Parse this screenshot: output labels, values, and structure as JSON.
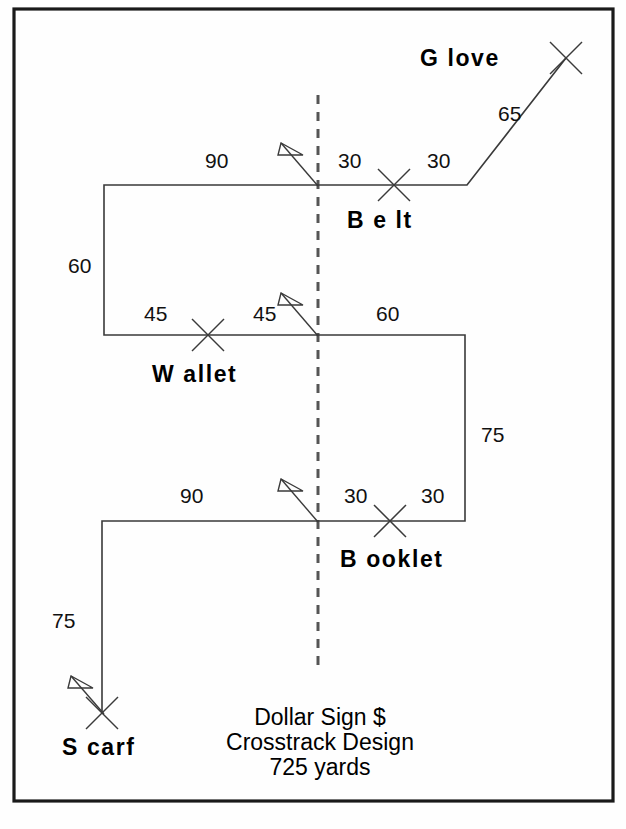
{
  "diagram": {
    "title_lines": [
      "Dollar Sign $",
      "Crosstrack Design",
      "725 yards"
    ],
    "total_distance": "725 yards",
    "design_name": "Dollar Sign $",
    "design_type": "Crosstrack Design",
    "colors": {
      "frame": "#1a1a1a",
      "route": "#3a3a3a",
      "centerline": "#555555",
      "text": "#000000",
      "background": "#ffffff"
    },
    "stations": [
      {
        "id": "glove",
        "label": "G love",
        "x": 566,
        "y": 58,
        "label_x": 468,
        "label_y": 64
      },
      {
        "id": "belt",
        "label": "B e lt",
        "x": 394,
        "y": 185,
        "label_x": 348,
        "label_y": 226
      },
      {
        "id": "wallet",
        "label": "W allet",
        "x": 208,
        "y": 335,
        "label_x": 152,
        "label_y": 381
      },
      {
        "id": "booklet",
        "label": "B ooklet",
        "x": 390,
        "y": 521,
        "label_x": 340,
        "label_y": 566
      },
      {
        "id": "scarf",
        "label": "S carf",
        "x": 102,
        "y": 713,
        "label_x": 62,
        "label_y": 755
      }
    ],
    "flags": [
      {
        "id": "flag-belt",
        "apex_x": 318,
        "apex_y": 185
      },
      {
        "id": "flag-wallet",
        "apex_x": 318,
        "apex_y": 335
      },
      {
        "id": "flag-booklet",
        "apex_x": 318,
        "apex_y": 521
      },
      {
        "id": "flag-scarf",
        "apex_x": 102,
        "apex_y": 713
      }
    ],
    "distance_labels": [
      {
        "id": "dist-glove-65",
        "value": "65",
        "x": 498,
        "y": 121
      },
      {
        "id": "dist-belt-left-90",
        "value": "90",
        "x": 215,
        "y": 168
      },
      {
        "id": "dist-belt-30a",
        "value": "30",
        "x": 348,
        "y": 168
      },
      {
        "id": "dist-belt-30b",
        "value": "30",
        "x": 437,
        "y": 168
      },
      {
        "id": "dist-left-60",
        "value": "60",
        "x": 70,
        "y": 273
      },
      {
        "id": "dist-wallet-45a",
        "value": "45",
        "x": 149,
        "y": 320
      },
      {
        "id": "dist-wallet-45b",
        "value": "45",
        "x": 258,
        "y": 320
      },
      {
        "id": "dist-wallet-60",
        "value": "60",
        "x": 378,
        "y": 320
      },
      {
        "id": "dist-right-75",
        "value": "75",
        "x": 481,
        "y": 442
      },
      {
        "id": "dist-booklet-90",
        "value": "90",
        "x": 183,
        "y": 502
      },
      {
        "id": "dist-booklet-30a",
        "value": "30",
        "x": 346,
        "y": 502
      },
      {
        "id": "dist-booklet-30b",
        "value": "30",
        "x": 424,
        "y": 502
      },
      {
        "id": "dist-scarf-75",
        "value": "75",
        "x": 55,
        "y": 627
      }
    ],
    "route_path": "M 566 58 L 467 185 L 104 185 L 104 335 L 465 335 L 465 521 L 102 521 L 102 713",
    "route_segments": [
      {
        "id": "seg-glove-bend",
        "from": [
          566,
          58
        ],
        "to": [
          467,
          185
        ]
      },
      {
        "id": "seg-bend-belt",
        "from": [
          467,
          185
        ],
        "to": [
          104,
          185
        ]
      },
      {
        "id": "seg-belt-wallet",
        "from": [
          104,
          185
        ],
        "to": [
          104,
          335
        ]
      },
      {
        "id": "seg-wallet-right",
        "from": [
          104,
          335
        ],
        "to": [
          465,
          335
        ]
      },
      {
        "id": "seg-right-down",
        "from": [
          465,
          335
        ],
        "to": [
          465,
          521
        ]
      },
      {
        "id": "seg-booklet-left",
        "from": [
          465,
          521
        ],
        "to": [
          102,
          521
        ]
      },
      {
        "id": "seg-left-scarf",
        "from": [
          102,
          521
        ],
        "to": [
          102,
          713
        ]
      }
    ],
    "centerline": {
      "x": 318,
      "y_top": 95,
      "y_bottom": 672
    },
    "frame": {
      "x": 14,
      "y": 9,
      "width": 599,
      "height": 792
    }
  }
}
